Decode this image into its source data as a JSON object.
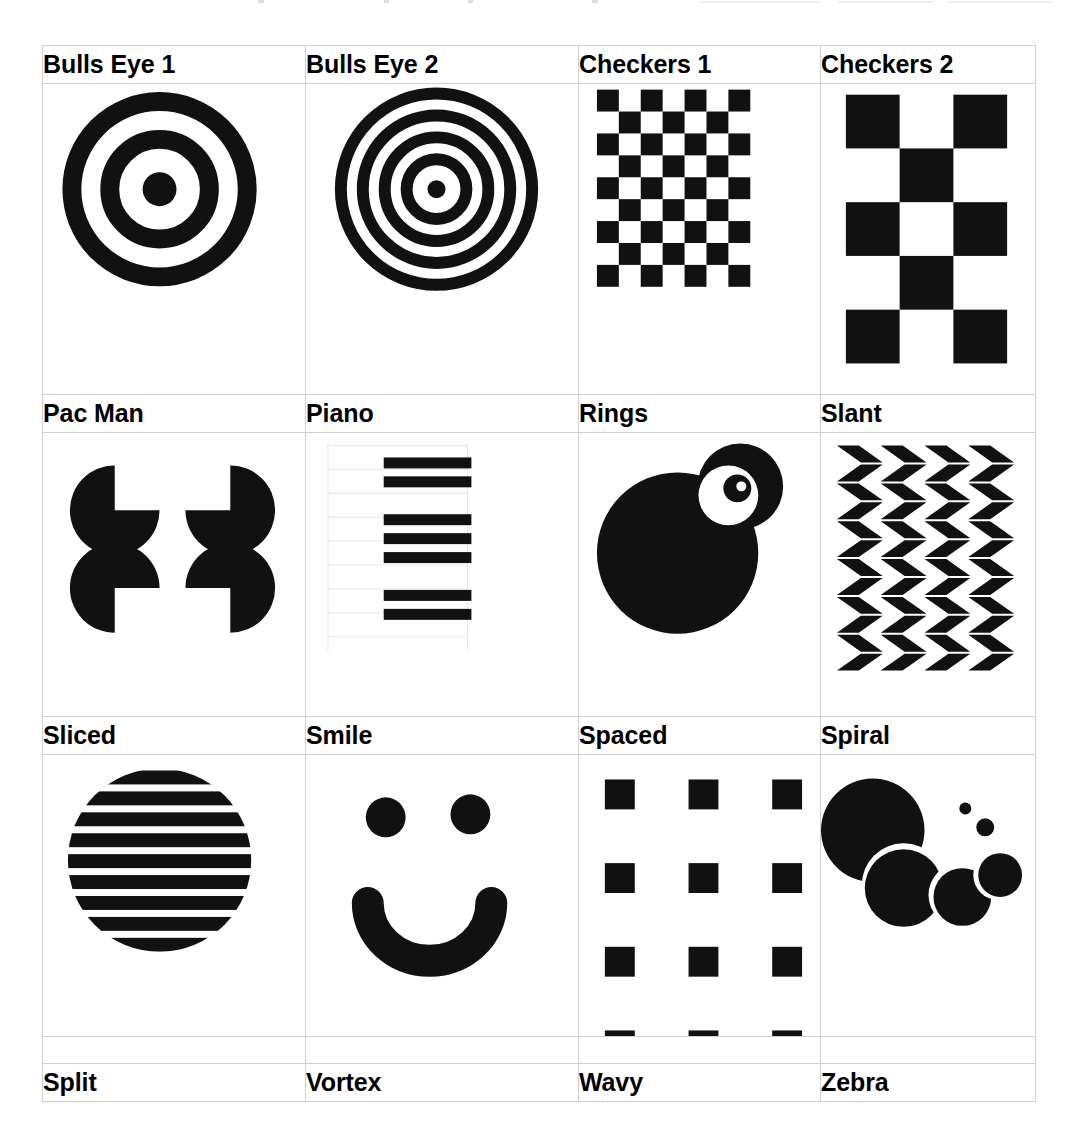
{
  "page": {
    "background_color": "#ffffff",
    "ink_color": "#111111",
    "grid_line_color": "#cfcfd4"
  },
  "table": {
    "columns": 4,
    "label_rows": 4,
    "pattern_rows": 3,
    "rows": [
      {
        "labels": [
          "Bulls Eye 1",
          "Bulls Eye 2",
          "Checkers 1",
          "Checkers 2"
        ],
        "patterns": [
          "bulls-eye-1",
          "bulls-eye-2",
          "checkers-1",
          "checkers-2"
        ]
      },
      {
        "labels": [
          "Pac Man",
          "Piano",
          "Rings",
          "Slant"
        ],
        "patterns": [
          "pac-man",
          "piano",
          "rings",
          "slant"
        ]
      },
      {
        "labels": [
          "Sliced",
          "Smile",
          "Spaced",
          "Spiral"
        ],
        "patterns": [
          "sliced",
          "smile",
          "spaced",
          "spiral"
        ]
      },
      {
        "labels": [
          "Split",
          "Vortex",
          "Wavy",
          "Zebra"
        ],
        "patterns": []
      }
    ]
  },
  "patterns": {
    "bulls-eye-1": {
      "name": "Bulls Eye 1",
      "kind": "concentric-circles",
      "rings": 2,
      "has_center_dot": true,
      "ring_stroke_width": 19,
      "outer_radius": 88,
      "center_dot_radius": 17
    },
    "bulls-eye-2": {
      "name": "Bulls Eye 2",
      "kind": "concentric-circles",
      "rings": 4,
      "has_center_dot": true,
      "ring_stroke_width": 12,
      "outer_radius": 96,
      "center_dot_radius": 9
    },
    "checkers-1": {
      "name": "Checkers 1",
      "kind": "checkerboard",
      "columns": 7,
      "rows": 9,
      "cell_size": 22,
      "start_filled": true
    },
    "checkers-2": {
      "name": "Checkers 2",
      "kind": "checkerboard",
      "columns": 3,
      "rows": 5,
      "cell_size": 54,
      "start_filled": true
    },
    "pac-man": {
      "name": "Pac Man",
      "kind": "kanizsa-square",
      "count": 4,
      "disc_radius": 45,
      "notch_degrees": 90
    },
    "piano": {
      "name": "Piano",
      "kind": "bars",
      "groups": [
        2,
        3,
        2
      ],
      "bar_width": 88,
      "bar_height": 11,
      "has_faint_guides": true,
      "guide_color": "#e6e6ea"
    },
    "rings": {
      "name": "Rings",
      "kind": "overlapping-discs",
      "disc_count": 3,
      "alternating_fill": true
    },
    "slant": {
      "name": "Slant",
      "kind": "chevron-parallelograms",
      "columns": 4,
      "rows": 6,
      "slant_degrees": 35
    },
    "sliced": {
      "name": "Sliced",
      "kind": "striped-circle",
      "stripes": 10,
      "stripe_height": 14,
      "gap_height": 7,
      "radius": 92
    },
    "smile": {
      "name": "Smile",
      "kind": "face",
      "eyes": 2,
      "eye_radius": 20,
      "mouth": "arc",
      "mouth_stroke_width": 32
    },
    "spaced": {
      "name": "Spaced",
      "kind": "square-grid",
      "columns": 3,
      "rows": 4,
      "square_size": 30,
      "gap": 27
    },
    "spiral": {
      "name": "Spiral",
      "kind": "decreasing-discs",
      "disc_count": 6
    }
  },
  "top_artifact": {
    "description": "faint cropped scan line at the top edge of the page",
    "flecks": [
      {
        "x": 258,
        "w": 6
      },
      {
        "x": 384,
        "w": 5
      },
      {
        "x": 468,
        "w": 5
      },
      {
        "x": 592,
        "w": 6
      }
    ],
    "smears": [
      {
        "x": 700,
        "w": 120
      },
      {
        "x": 838,
        "w": 96
      },
      {
        "x": 948,
        "w": 104
      }
    ]
  }
}
